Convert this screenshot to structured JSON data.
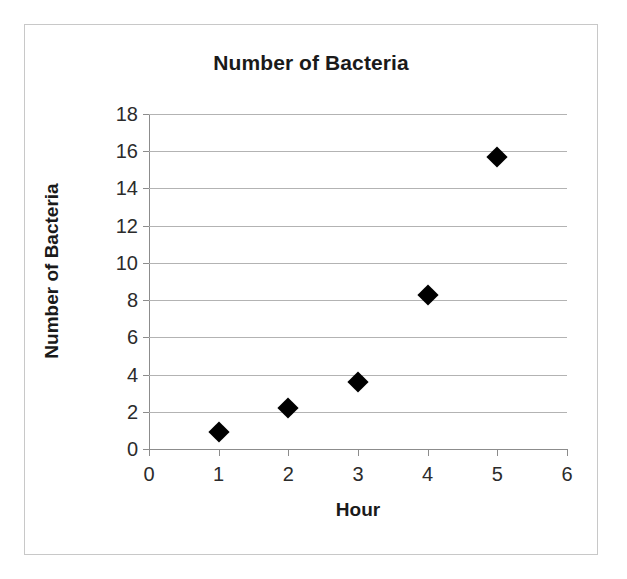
{
  "chart_data": {
    "type": "scatter",
    "title": "Number of Bacteria",
    "xlabel": "Hour",
    "ylabel": "Number of Bacteria",
    "xlim": [
      0,
      6
    ],
    "ylim": [
      0,
      18
    ],
    "xticks": [
      0,
      1,
      2,
      3,
      4,
      5,
      6
    ],
    "yticks": [
      0,
      2,
      4,
      6,
      8,
      10,
      12,
      14,
      16,
      18
    ],
    "grid": "horizontal",
    "legend": "none",
    "marker": "diamond",
    "marker_color": "#000000",
    "x": [
      1,
      2,
      3,
      4,
      5
    ],
    "y": [
      0.9,
      2.2,
      3.6,
      8.3,
      15.7
    ],
    "points": [
      {
        "x": 1,
        "y": 0.9
      },
      {
        "x": 2,
        "y": 2.2
      },
      {
        "x": 3,
        "y": 3.6
      },
      {
        "x": 4,
        "y": 8.3
      },
      {
        "x": 5,
        "y": 15.7
      }
    ]
  },
  "colors": {
    "border": "#c8c8c8",
    "gridline": "#b3b3b3",
    "axis": "#8c8c8c",
    "text": "#1a1a1a",
    "tick_text": "#2b2b2b"
  }
}
